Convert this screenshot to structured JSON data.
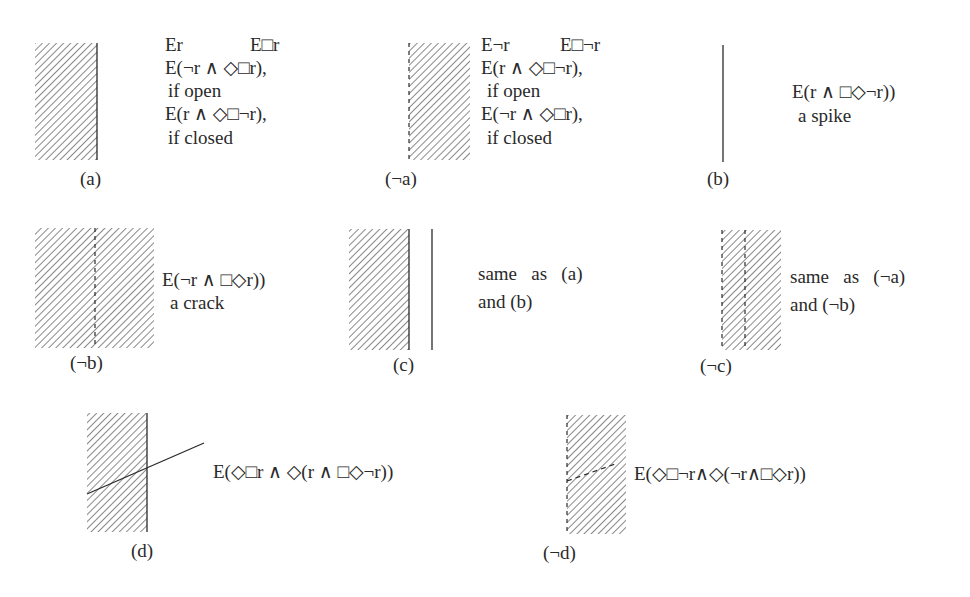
{
  "panels": [
    {
      "id": "a",
      "label": "(a)",
      "lines": [
        "Er",
        "E□r",
        "E(¬r ∧ ◇□r),",
        "if open",
        "E(r ∧ ◇□¬r),",
        "if closed"
      ]
    },
    {
      "id": "not-a",
      "label": "(¬a)",
      "lines": [
        "E¬r",
        "E□¬r",
        "E(r ∧ ◇□¬r),",
        "if open",
        "E(¬r ∧ ◇□r),",
        "if closed"
      ]
    },
    {
      "id": "b",
      "label": "(b)",
      "lines": [
        "E(r ∧ □◇¬r))",
        "a spike"
      ]
    },
    {
      "id": "not-b",
      "label": "(¬b)",
      "lines": [
        "E(¬r ∧ □◇r))",
        "a crack"
      ]
    },
    {
      "id": "c",
      "label": "(c)",
      "lines": [
        "same   as   (a)",
        "and (b)"
      ]
    },
    {
      "id": "not-c",
      "label": "(¬c)",
      "lines": [
        "same   as   (¬a)",
        "and (¬b)"
      ]
    },
    {
      "id": "d",
      "label": "(d)",
      "lines": [
        "E(◇□r ∧ ◇(r ∧ □◇¬r))"
      ]
    },
    {
      "id": "not-d",
      "label": "(¬d)",
      "lines": [
        "E(◇□¬r∧◇(¬r∧□◇r))"
      ]
    }
  ],
  "colors": {
    "ink": "#2a2a2a",
    "hatch": "#6a6a6a",
    "background": "#ffffff"
  }
}
